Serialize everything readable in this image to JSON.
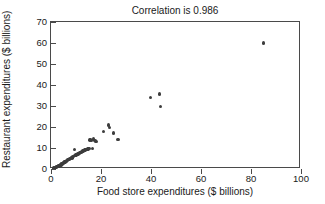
{
  "chart_data": {
    "type": "scatter",
    "title": "Correlation is 0.986",
    "xlabel": "Food store expenditures ($ billions)",
    "ylabel": "Restaurant expenditures ($ billions)",
    "xlim": [
      0,
      100
    ],
    "ylim": [
      0,
      70
    ],
    "xticks": [
      0,
      20,
      40,
      60,
      80,
      100
    ],
    "yticks": [
      0,
      10,
      20,
      30,
      40,
      50,
      60,
      70
    ],
    "grid": false,
    "legend": null,
    "marker_color": "#3d3d3d",
    "correlation": 0.986,
    "series": [
      {
        "name": "Food store vs restaurant expenditures",
        "points": [
          [
            1.2,
            0.4
          ],
          [
            1.6,
            0.6
          ],
          [
            1.9,
            0.8
          ],
          [
            2.2,
            0.9
          ],
          [
            2.4,
            1.1
          ],
          [
            2.6,
            1.3
          ],
          [
            2.8,
            1.2
          ],
          [
            3.0,
            1.5
          ],
          [
            3.2,
            1.4
          ],
          [
            3.4,
            1.8
          ],
          [
            3.6,
            1.7
          ],
          [
            3.8,
            2.1
          ],
          [
            4.0,
            2.0
          ],
          [
            4.2,
            2.4
          ],
          [
            4.4,
            2.3
          ],
          [
            4.6,
            2.7
          ],
          [
            4.8,
            2.6
          ],
          [
            5.0,
            3.1
          ],
          [
            5.2,
            3.0
          ],
          [
            5.4,
            3.4
          ],
          [
            5.6,
            3.3
          ],
          [
            5.8,
            3.7
          ],
          [
            6.0,
            3.6
          ],
          [
            6.3,
            4.0
          ],
          [
            6.6,
            4.2
          ],
          [
            6.9,
            4.4
          ],
          [
            7.2,
            4.6
          ],
          [
            7.5,
            4.9
          ],
          [
            7.8,
            5.1
          ],
          [
            8.1,
            5.4
          ],
          [
            8.4,
            5.3
          ],
          [
            8.7,
            5.8
          ],
          [
            9.0,
            6.0
          ],
          [
            9.3,
            9.4
          ],
          [
            9.6,
            6.3
          ],
          [
            10.0,
            6.6
          ],
          [
            10.4,
            7.0
          ],
          [
            10.8,
            7.2
          ],
          [
            11.2,
            7.5
          ],
          [
            11.6,
            7.8
          ],
          [
            12.0,
            8.0
          ],
          [
            12.4,
            8.3
          ],
          [
            12.8,
            8.6
          ],
          [
            13.2,
            8.8
          ],
          [
            13.6,
            9.0
          ],
          [
            14.0,
            9.2
          ],
          [
            14.4,
            9.4
          ],
          [
            14.8,
            9.6
          ],
          [
            15.2,
            9.8
          ],
          [
            15.6,
            13.9
          ],
          [
            15.9,
            14.1
          ],
          [
            16.2,
            13.7
          ],
          [
            16.5,
            9.9
          ],
          [
            17.0,
            14.2
          ],
          [
            17.4,
            13.6
          ],
          [
            17.8,
            13.4
          ],
          [
            18.2,
            13.2
          ],
          [
            21.0,
            17.9
          ],
          [
            23.0,
            21.0
          ],
          [
            23.4,
            19.8
          ],
          [
            25.0,
            17.2
          ],
          [
            26.8,
            14.0
          ],
          [
            39.8,
            34.0
          ],
          [
            43.4,
            35.7
          ],
          [
            43.9,
            29.8
          ],
          [
            85.0,
            60.0
          ]
        ]
      }
    ]
  }
}
